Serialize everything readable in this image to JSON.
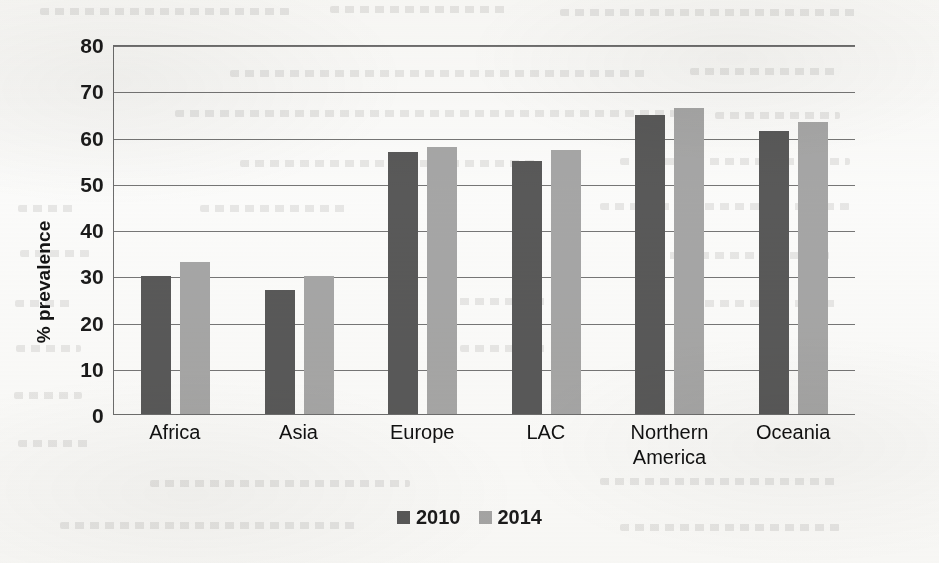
{
  "chart_data": {
    "type": "bar",
    "title": "",
    "xlabel": "",
    "ylabel": "% prevalence",
    "ylim": [
      0,
      80
    ],
    "yticks": [
      0,
      10,
      20,
      30,
      40,
      50,
      60,
      70,
      80
    ],
    "grid": true,
    "legend_position": "bottom",
    "categories": [
      "Africa",
      "Asia",
      "Europe",
      "LAC",
      "Northern America",
      "Oceania"
    ],
    "category_lines": [
      [
        "Africa"
      ],
      [
        "Asia"
      ],
      [
        "Europe"
      ],
      [
        "LAC"
      ],
      [
        "Northern",
        "America"
      ],
      [
        "Oceania"
      ]
    ],
    "series": [
      {
        "name": "2010",
        "color": "#595959",
        "values": [
          30,
          27,
          57,
          55,
          65,
          61.5
        ]
      },
      {
        "name": "2014",
        "color": "#a6a6a6",
        "values": [
          33,
          30,
          58,
          57.5,
          66.5,
          63.5
        ]
      }
    ]
  },
  "legend": {
    "items": [
      {
        "label": "2010",
        "color": "#595959"
      },
      {
        "label": "2014",
        "color": "#a6a6a6"
      }
    ]
  },
  "axis": {
    "y_title": "% prevalence",
    "y_tick_labels": [
      "80",
      "70",
      "60",
      "50",
      "40",
      "30",
      "20",
      "10",
      "0"
    ]
  }
}
